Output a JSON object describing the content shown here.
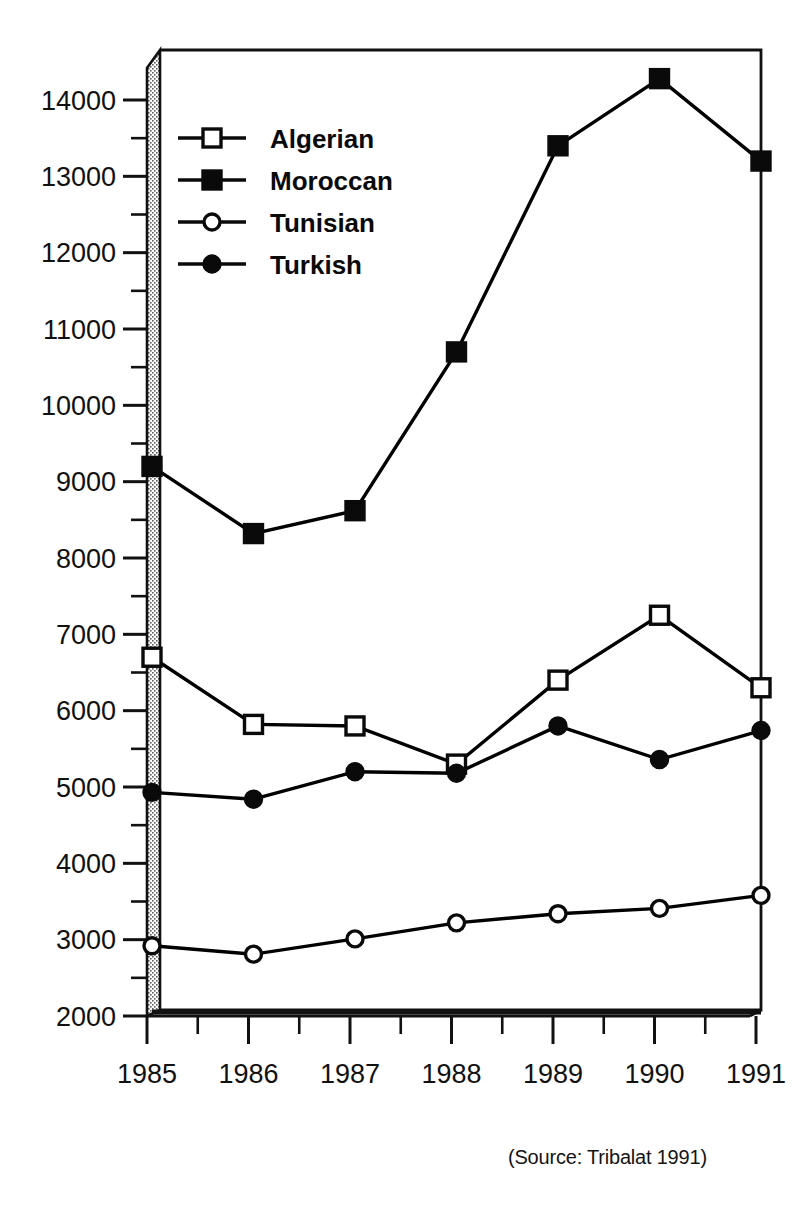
{
  "source_note": "(Source: Tribalat 1991)",
  "top_cut_text": "",
  "bottom_cut_text": "",
  "legend": {
    "position": "upper-left-inside",
    "entries": [
      {
        "label": "Algerian",
        "marker": "open-square"
      },
      {
        "label": "Moroccan",
        "marker": "filled-square"
      },
      {
        "label": "Tunisian",
        "marker": "open-circle"
      },
      {
        "label": "Turkish",
        "marker": "filled-circle"
      }
    ]
  },
  "axes": {
    "y_ticks": [
      "14000",
      "13000",
      "12000",
      "11000",
      "10000",
      "9000",
      "8000",
      "7000",
      "6000",
      "5000",
      "4000",
      "3000",
      "2000"
    ],
    "x_ticks": [
      "1985",
      "1986",
      "1987",
      "1988",
      "1989",
      "1990",
      "1991"
    ]
  },
  "chart_data": {
    "type": "line",
    "title": "",
    "subtitle": "",
    "xlabel": "",
    "ylabel": "",
    "x": [
      1985,
      1986,
      1987,
      1988,
      1989,
      1990,
      1991
    ],
    "categories": [
      "1985",
      "1986",
      "1987",
      "1988",
      "1989",
      "1990",
      "1991"
    ],
    "series": [
      {
        "name": "Algerian",
        "marker": "open-square",
        "color": "#000000",
        "values": [
          6700,
          5820,
          5800,
          5300,
          6400,
          7250,
          6300
        ]
      },
      {
        "name": "Moroccan",
        "marker": "filled-square",
        "color": "#000000",
        "values": [
          9200,
          8320,
          8620,
          10700,
          13400,
          14280,
          13200
        ]
      },
      {
        "name": "Tunisian",
        "marker": "open-circle",
        "color": "#000000",
        "values": [
          2920,
          2810,
          3010,
          3220,
          3340,
          3410,
          3580
        ]
      },
      {
        "name": "Turkish",
        "marker": "filled-circle",
        "color": "#000000",
        "values": [
          4930,
          4840,
          5200,
          5180,
          5800,
          5360,
          5740
        ]
      }
    ],
    "xlim": [
      1985,
      1991
    ],
    "ylim": [
      2000,
      14850
    ],
    "y_major_step": 1000,
    "y_minor_step": 500,
    "x_minor_step": 0.5,
    "grid": false,
    "legend_position": "upper left",
    "floor_line_value": 2600,
    "style": "3d-ribbon-frame",
    "annotations": [
      "(Source: Tribalat 1991)"
    ]
  }
}
